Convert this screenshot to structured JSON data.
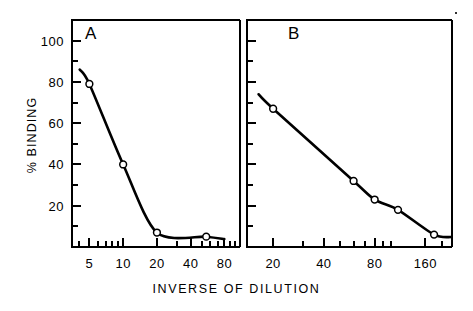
{
  "figure": {
    "xlabel": "INVERSE OF DILUTION",
    "ylabel": "% BINDING"
  },
  "panels": {
    "a": {
      "letter": "A"
    },
    "b": {
      "letter": "B"
    }
  },
  "y_ticks": [
    {
      "value": 100,
      "label": "100"
    },
    {
      "value": 80,
      "label": "80"
    },
    {
      "value": 60,
      "label": "60"
    },
    {
      "value": 40,
      "label": "40"
    },
    {
      "value": 20,
      "label": "20"
    }
  ],
  "x_ticks_a": [
    {
      "value": 5,
      "label": "5"
    },
    {
      "value": 10,
      "label": "10"
    },
    {
      "value": 20,
      "label": "20"
    },
    {
      "value": 40,
      "label": "40"
    },
    {
      "value": 80,
      "label": "80"
    }
  ],
  "x_ticks_b": [
    {
      "value": 20,
      "label": "20"
    },
    {
      "value": 40,
      "label": "40"
    },
    {
      "value": 80,
      "label": "80"
    },
    {
      "value": 160,
      "label": "160"
    }
  ],
  "chart_data": [
    {
      "type": "line",
      "panel": "A",
      "title": "A",
      "xlabel": "INVERSE OF DILUTION",
      "ylabel": "% BINDING",
      "xscale": "log",
      "xlim": [
        3.5,
        110
      ],
      "ylim": [
        0,
        110
      ],
      "grid": false,
      "legend": "none",
      "marker": "open-circle",
      "xticks": [
        5,
        10,
        20,
        40,
        80
      ],
      "yticks": [
        20,
        40,
        60,
        80,
        100
      ],
      "x": [
        5,
        10,
        20,
        55
      ],
      "y": [
        79,
        40,
        7,
        5
      ]
    },
    {
      "type": "line",
      "panel": "B",
      "title": "B",
      "xlabel": "INVERSE OF DILUTION",
      "ylabel": "% BINDING",
      "xscale": "log",
      "xlim": [
        14,
        230
      ],
      "ylim": [
        0,
        110
      ],
      "grid": false,
      "legend": "none",
      "marker": "open-circle",
      "xticks": [
        20,
        40,
        80,
        160
      ],
      "yticks": [
        20,
        40,
        60,
        80,
        100
      ],
      "x": [
        20,
        60,
        80,
        110,
        180
      ],
      "y": [
        67,
        32,
        23,
        18,
        6
      ]
    }
  ],
  "colors": {
    "ink": "#000000",
    "background": "#ffffff"
  }
}
